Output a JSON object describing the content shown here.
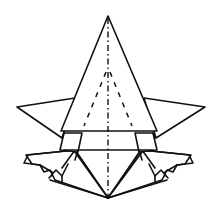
{
  "diagram": {
    "type": "origami-fold-diagram",
    "subject": "origami model, front view",
    "colors": {
      "line": "#111111",
      "background": "#ffffff"
    },
    "line_styles": {
      "solid": "edge",
      "dashed": "valley fold",
      "dash_dot": "mountain fold / center crease"
    },
    "parts": [
      {
        "id": "main-triangle",
        "label": "top triangular flap"
      },
      {
        "id": "left-wing",
        "label": "left point"
      },
      {
        "id": "right-wing",
        "label": "right point"
      },
      {
        "id": "left-leg",
        "label": "lower left flap"
      },
      {
        "id": "right-leg",
        "label": "lower right flap"
      },
      {
        "id": "body",
        "label": "lower body"
      }
    ]
  }
}
